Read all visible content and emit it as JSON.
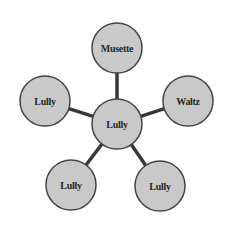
{
  "diagram": {
    "type": "hub-and-spoke",
    "style": {
      "node_fill": "#c9c9c9",
      "node_stroke": "#444444",
      "edge_color": "#383838",
      "text_color": "#262626"
    },
    "nodes": [
      {
        "id": "center",
        "label": "Lully",
        "cx": 117,
        "cy": 124,
        "r": 25
      },
      {
        "id": "top",
        "label": "Musette",
        "cx": 117,
        "cy": 48,
        "r": 25
      },
      {
        "id": "right",
        "label": "Waltz",
        "cx": 188,
        "cy": 101,
        "r": 25
      },
      {
        "id": "left",
        "label": "Lully",
        "cx": 45,
        "cy": 101,
        "r": 25
      },
      {
        "id": "bottom_left",
        "label": "Lully",
        "cx": 71,
        "cy": 185,
        "r": 25
      },
      {
        "id": "bottom_right",
        "label": "Lully",
        "cx": 160,
        "cy": 186,
        "r": 25
      }
    ],
    "edges": [
      {
        "from": "center",
        "to": "top"
      },
      {
        "from": "center",
        "to": "right"
      },
      {
        "from": "center",
        "to": "left"
      },
      {
        "from": "center",
        "to": "bottom_left"
      },
      {
        "from": "center",
        "to": "bottom_right"
      }
    ]
  }
}
